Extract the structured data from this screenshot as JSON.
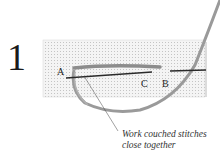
{
  "step": {
    "number": "1"
  },
  "points": {
    "a": "A",
    "b": "B",
    "c": "C"
  },
  "caption": {
    "line1": "Work couched stitches",
    "line2": "close together"
  },
  "colors": {
    "canvas": "#f2f2f2",
    "grid": "#c8c8c8",
    "thread": "#8a8a8a",
    "needle": "#2a2a2a"
  }
}
